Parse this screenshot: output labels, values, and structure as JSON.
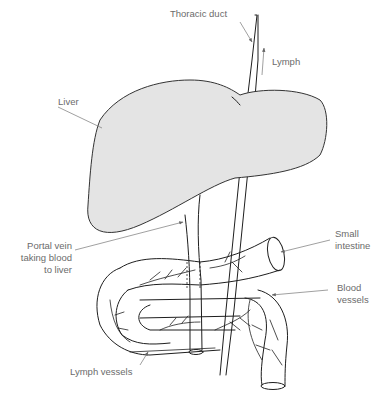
{
  "diagram": {
    "colors": {
      "liver_fill": "#e4e4e4",
      "outline": "#1e1e1e",
      "label_text": "#6b6b6b",
      "leader_line": "#777777",
      "background": "#ffffff"
    },
    "labels": {
      "thoracic_duct": "Thoracic duct",
      "lymph": "Lymph",
      "liver": "Liver",
      "portal_vein_line1": "Portal vein",
      "portal_vein_line2": "taking blood",
      "portal_vein_line3": "to liver",
      "small_intestine_line1": "Small",
      "small_intestine_line2": "intestine",
      "blood_vessels_line1": "Blood",
      "blood_vessels_line2": "vessels",
      "lymph_vessels": "Lymph vessels"
    }
  }
}
